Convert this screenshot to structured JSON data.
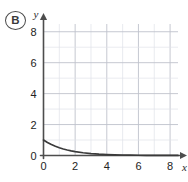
{
  "choice": {
    "label": "B",
    "name": "answer-choice-badge"
  },
  "chart_data": {
    "type": "line",
    "title": "",
    "subtitle": "",
    "xlabel": "x",
    "ylabel": "y",
    "xlim": [
      0,
      8.5
    ],
    "ylim": [
      0,
      8.5
    ],
    "grid": true,
    "grid_step": 1,
    "legend": null,
    "legend_position": "none",
    "x_ticks": [
      0,
      2,
      4,
      6,
      8
    ],
    "x_tick_labels": [
      "0",
      "2",
      "4",
      "6",
      "8"
    ],
    "y_ticks": [
      0,
      2,
      4,
      6,
      8
    ],
    "y_tick_labels": [
      "0",
      "2",
      "4",
      "6",
      "8"
    ],
    "annotations": [],
    "series": [
      {
        "name": "exponential decay",
        "description": "y = (0.5)^x, decreasing curve from (0, 1) approaching y = 0",
        "x": [
          0,
          0.25,
          0.5,
          0.75,
          1,
          1.25,
          1.5,
          1.75,
          2,
          2.5,
          3,
          3.5,
          4,
          4.5,
          5,
          5.5,
          6,
          6.5,
          7,
          7.5,
          8,
          8.5
        ],
        "y": [
          1,
          0.841,
          0.707,
          0.595,
          0.5,
          0.42,
          0.354,
          0.297,
          0.25,
          0.177,
          0.125,
          0.088,
          0.063,
          0.044,
          0.031,
          0.022,
          0.016,
          0.011,
          0.008,
          0.006,
          0.004,
          0.003
        ]
      }
    ]
  },
  "colors": {
    "curve": "#3a3a3a",
    "axis": "#4d4d4d",
    "grid_major": "#bfc3cc",
    "grid_minor": "#dfe2e8",
    "background": "#ffffff",
    "text": "#232323"
  }
}
